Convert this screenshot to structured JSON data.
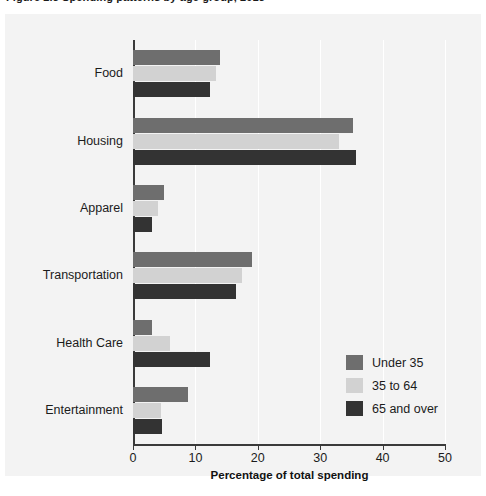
{
  "figure": {
    "caption": "Figure 2.3  Spending patterns by age group, 2013"
  },
  "chart_data": {
    "type": "bar",
    "orientation": "horizontal",
    "title": "",
    "xlabel": "Percentage of total spending",
    "ylabel": "",
    "xlim": [
      0,
      50
    ],
    "xticks": [
      "0",
      "10",
      "20",
      "30",
      "40",
      "50"
    ],
    "grid": true,
    "legend_position": "inside-bottom-right",
    "categories": [
      "Food",
      "Housing",
      "Apparel",
      "Transportation",
      "Health Care",
      "Entertainment"
    ],
    "series": [
      {
        "name": "Under 35",
        "color": "#6e6e6e",
        "values": [
          14.0,
          35.3,
          5.0,
          19.0,
          3.0,
          8.8
        ]
      },
      {
        "name": "35 to 64",
        "color": "#d2d2d2",
        "values": [
          13.3,
          33.0,
          4.0,
          17.5,
          6.0,
          4.5
        ]
      },
      {
        "name": "65 and over",
        "color": "#333333",
        "values": [
          12.3,
          35.8,
          3.0,
          16.5,
          12.3,
          4.7
        ]
      }
    ]
  },
  "colors": {
    "plot_background": "#f3f3f3",
    "gridline": "#ffffff",
    "axis": "#3a3a3a",
    "text": "#1b1b1b"
  }
}
